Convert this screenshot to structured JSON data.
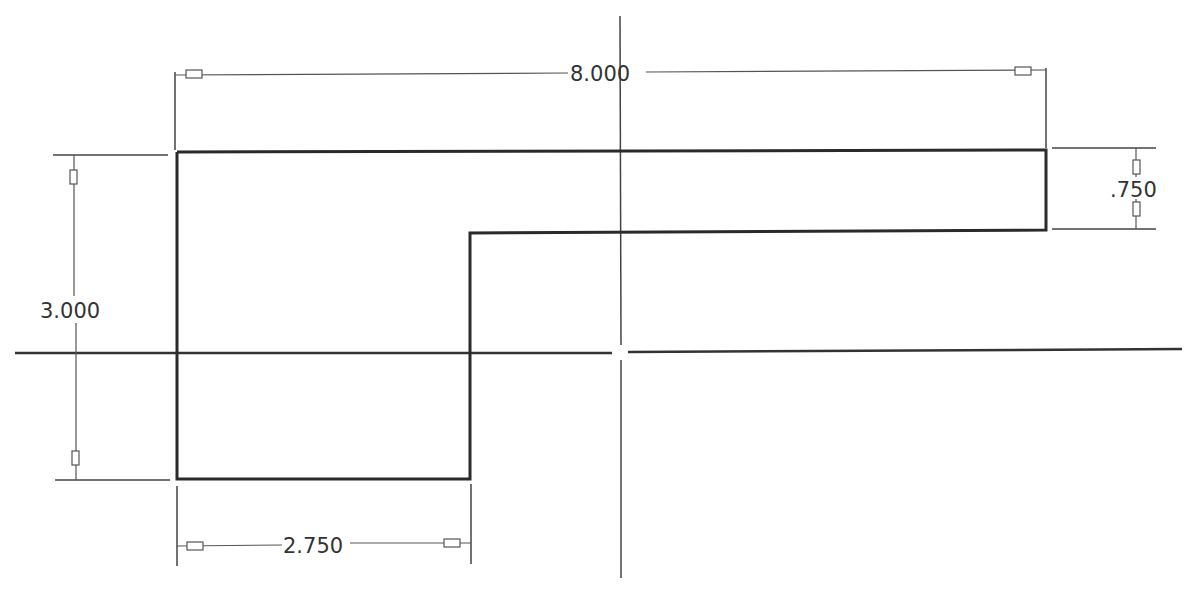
{
  "drawing": {
    "type": "2D sketch with dimensions",
    "colors": {
      "background": "#ffffff",
      "profile": "#2a2a2a",
      "axis": "#333333",
      "dimension": "#444444",
      "text": "#333333"
    },
    "dimensions": {
      "overall_width": "8.000",
      "overall_height": "3.000",
      "flange_thickness": ".750",
      "bottom_width": "2.750"
    },
    "axes": {
      "horizontal": "horizontal-centerline",
      "vertical": "vertical-centerline"
    }
  }
}
